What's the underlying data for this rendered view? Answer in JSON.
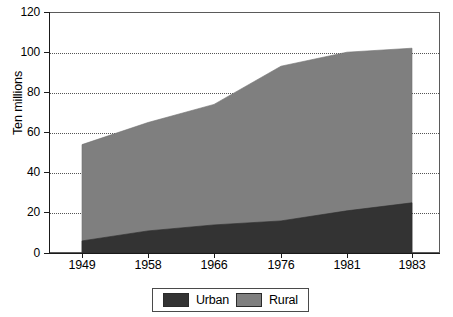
{
  "chart_data": {
    "type": "area",
    "stacked": true,
    "title": "",
    "xlabel": "",
    "ylabel": "Ten millions",
    "categories": [
      "1949",
      "1958",
      "1966",
      "1976",
      "1981",
      "1983"
    ],
    "series": [
      {
        "name": "Urban",
        "color": "#333333",
        "values": [
          6,
          11,
          14,
          16,
          21,
          25
        ]
      },
      {
        "name": "Rural",
        "color": "#7f7f7f",
        "values": [
          48,
          54,
          60,
          77,
          79,
          77
        ]
      }
    ],
    "totals": [
      54,
      65,
      74,
      93,
      100,
      102
    ],
    "ylim": [
      0,
      120
    ],
    "yticks": [
      0,
      20,
      40,
      60,
      80,
      100,
      120
    ],
    "ytick_labels": [
      "0",
      "20",
      "40",
      "60",
      "80",
      "100",
      "120"
    ],
    "grid": "horizontal-dotted",
    "legend_position": "bottom-center",
    "legend": [
      "Urban",
      "Rural"
    ]
  },
  "axes": {
    "y_title": "Ten millions"
  },
  "legend": {
    "items": [
      {
        "label": "Urban",
        "color": "#333333"
      },
      {
        "label": "Rural",
        "color": "#7f7f7f"
      }
    ]
  }
}
